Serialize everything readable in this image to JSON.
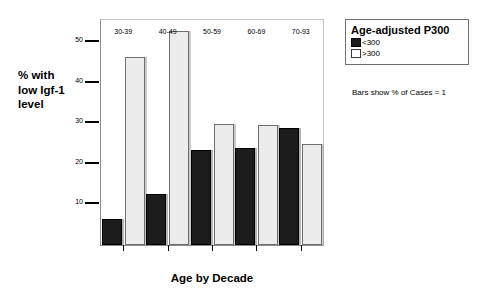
{
  "chart_data": {
    "type": "bar",
    "title": "",
    "xlabel": "Age by Decade",
    "ylabel": "% with low Igf-1 level",
    "ylabel_lines": [
      "% with",
      "low Igf-1",
      "level"
    ],
    "categories": [
      "30-39",
      "40-49",
      "50-59",
      "60-69",
      "70-93"
    ],
    "series": [
      {
        "name": "<300",
        "color": "#1c1c1c",
        "values": [
          6.3,
          12.5,
          23.5,
          24.0,
          28.9
        ]
      },
      {
        "name": ">300",
        "color": "#ececec",
        "values": [
          46.3,
          52.7,
          29.9,
          29.6,
          24.9
        ]
      }
    ],
    "ylim": [
      0,
      55.5
    ],
    "yticks": [
      10,
      20,
      30,
      40,
      50
    ],
    "ytick_labels": [
      "10",
      "20",
      "30",
      "40",
      "50"
    ],
    "grid": false,
    "legend_position": "right"
  },
  "legend": {
    "title": "Age-adjusted P300",
    "entries": [
      {
        "label": "<300",
        "swatch": "dark-swatch-icon"
      },
      {
        "label": ">300",
        "swatch": "light-swatch-icon"
      }
    ],
    "caption": "Bars show % of Cases = 1"
  }
}
